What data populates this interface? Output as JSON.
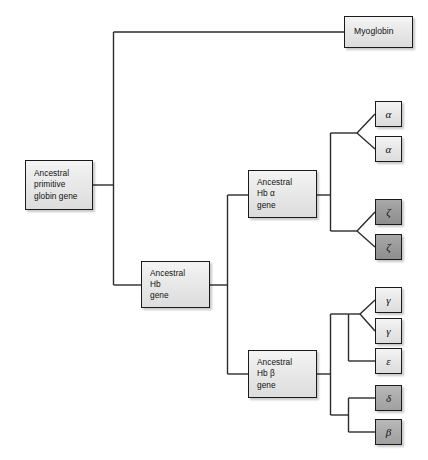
{
  "diagram": {
    "type": "phylogenetic-tree",
    "background_color": "#ffffff",
    "line_color": "#2b2b2b",
    "box_border_color": "#1b1b1b",
    "box_fill_light": "#e8e8e8",
    "box_fill_medium": "#aeaeae",
    "box_fill_dark": "#9a9a9a"
  },
  "nodes": {
    "root": {
      "id": "ancestral-primitive-globin-gene",
      "label": "Ancestral\nprimitive\nglobin gene",
      "shade": "light"
    },
    "myoglobin": {
      "id": "myoglobin",
      "label": "Myoglobin",
      "shade": "light"
    },
    "ancestral_hb": {
      "id": "ancestral-hb-gene",
      "label": "Ancestral\nHb\ngene",
      "shade": "light"
    },
    "ancestral_hb_alpha": {
      "id": "ancestral-hb-alpha-gene",
      "label": "Ancestral\nHb α\ngene",
      "shade": "light"
    },
    "ancestral_hb_beta": {
      "id": "ancestral-hb-beta-gene",
      "label": "Ancestral\nHb β\ngene",
      "shade": "light"
    }
  },
  "leaves": [
    {
      "id": "alpha-1",
      "label": "α",
      "shade": "light",
      "group": "alpha"
    },
    {
      "id": "alpha-2",
      "label": "α",
      "shade": "light",
      "group": "alpha"
    },
    {
      "id": "zeta-1",
      "label": "ζ",
      "shade": "dark",
      "group": "zeta"
    },
    {
      "id": "zeta-2",
      "label": "ζ",
      "shade": "dark",
      "group": "zeta"
    },
    {
      "id": "gamma-1",
      "label": "γ",
      "shade": "light",
      "group": "gamma"
    },
    {
      "id": "gamma-2",
      "label": "γ",
      "shade": "light",
      "group": "gamma"
    },
    {
      "id": "epsilon",
      "label": "ε",
      "shade": "light",
      "group": "epsilon"
    },
    {
      "id": "delta",
      "label": "δ",
      "shade": "medium",
      "group": "delta-beta"
    },
    {
      "id": "beta",
      "label": "β",
      "shade": "medium",
      "group": "delta-beta"
    }
  ]
}
